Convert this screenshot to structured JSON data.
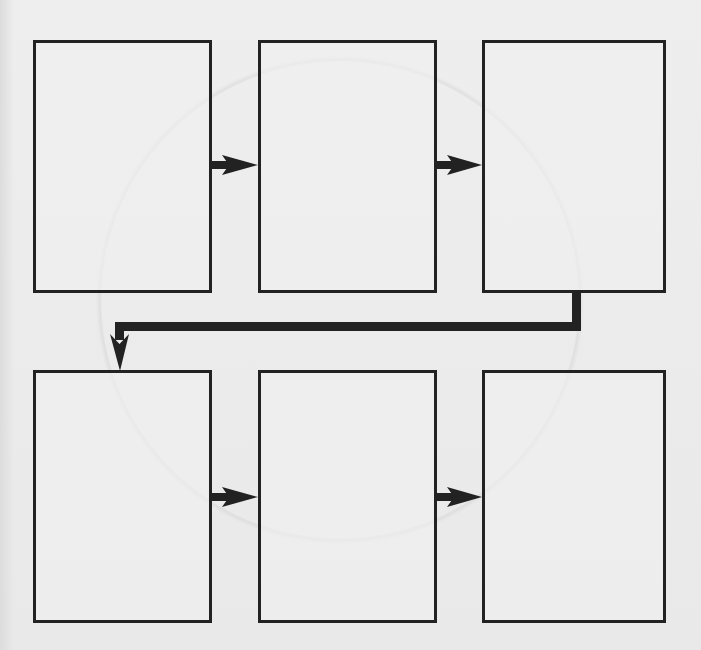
{
  "diagram": {
    "type": "process-flow",
    "layout": "2 rows x 3 columns",
    "colors": {
      "background": "#ececec",
      "stroke": "#222222"
    },
    "steps": [
      {
        "id": "step-1",
        "label": "",
        "row": 1,
        "col": 1
      },
      {
        "id": "step-2",
        "label": "",
        "row": 1,
        "col": 2
      },
      {
        "id": "step-3",
        "label": "",
        "row": 1,
        "col": 3
      },
      {
        "id": "step-4",
        "label": "",
        "row": 2,
        "col": 1
      },
      {
        "id": "step-5",
        "label": "",
        "row": 2,
        "col": 2
      },
      {
        "id": "step-6",
        "label": "",
        "row": 2,
        "col": 3
      }
    ],
    "connections": [
      {
        "from": "step-1",
        "to": "step-2",
        "style": "straight-arrow"
      },
      {
        "from": "step-2",
        "to": "step-3",
        "style": "straight-arrow"
      },
      {
        "from": "step-3",
        "to": "step-4",
        "style": "elbow-arrow"
      },
      {
        "from": "step-4",
        "to": "step-5",
        "style": "straight-arrow"
      },
      {
        "from": "step-5",
        "to": "step-6",
        "style": "straight-arrow"
      }
    ]
  }
}
